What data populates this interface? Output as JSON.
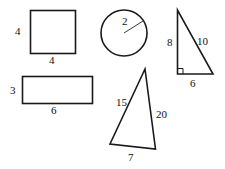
{
  "figure": {
    "background_color": "#ffffff",
    "stroke_color": "#1a1a1a",
    "label_color": "#111111",
    "shapes": [
      {
        "name": "square",
        "labels": {
          "left": "4",
          "bottom": "4"
        }
      },
      {
        "name": "circle",
        "labels": {
          "radius": "2"
        }
      },
      {
        "name": "right-triangle",
        "labels": {
          "left_leg": "8",
          "hypotenuse": "10",
          "bottom_leg": "6"
        }
      },
      {
        "name": "rectangle",
        "labels": {
          "left": "3",
          "bottom": "6"
        }
      },
      {
        "name": "scalene-triangle",
        "labels": {
          "left_side": "15",
          "right_side": "20",
          "bottom": "7"
        }
      }
    ]
  },
  "labels": {
    "square_left": "4",
    "square_bottom": "4",
    "circle_radius": "2",
    "right_triangle_left": "8",
    "right_triangle_hyp": "10",
    "right_triangle_bottom": "6",
    "rectangle_left": "3",
    "rectangle_bottom": "6",
    "scalene_left": "15",
    "scalene_right": "20",
    "scalene_bottom": "7"
  }
}
